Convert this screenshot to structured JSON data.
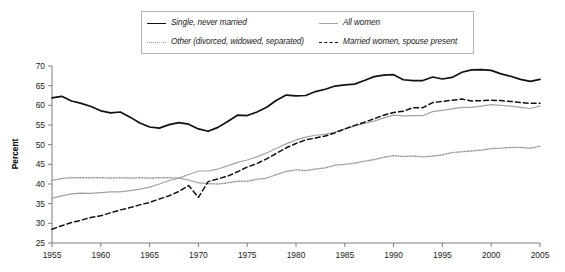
{
  "chart_data": {
    "type": "line",
    "title": "",
    "xlabel": "",
    "ylabel": "Percent",
    "xlim": [
      1955,
      2005
    ],
    "ylim": [
      25,
      70
    ],
    "grid": false,
    "legend_position": "top",
    "x_ticks": [
      "1955",
      "1960",
      "1965",
      "1970",
      "1975",
      "1980",
      "1985",
      "1990",
      "1995",
      "2000",
      "2005"
    ],
    "y_ticks": [
      "25",
      "30",
      "35",
      "40",
      "45",
      "50",
      "55",
      "60",
      "65",
      "70"
    ],
    "x": [
      1955,
      1956,
      1957,
      1958,
      1959,
      1960,
      1961,
      1962,
      1963,
      1964,
      1965,
      1966,
      1967,
      1968,
      1969,
      1970,
      1971,
      1972,
      1973,
      1974,
      1975,
      1976,
      1977,
      1978,
      1979,
      1980,
      1981,
      1982,
      1983,
      1984,
      1985,
      1986,
      1987,
      1988,
      1989,
      1990,
      1991,
      1992,
      1993,
      1994,
      1995,
      1996,
      1997,
      1998,
      1999,
      2000,
      2001,
      2002,
      2003,
      2004,
      2005
    ],
    "series": [
      {
        "name": "Single, never married",
        "style": "solid",
        "color": "#111111",
        "width": 1.7,
        "values": [
          61.9,
          62.3,
          61.1,
          60.5,
          59.7,
          58.6,
          58.1,
          58.3,
          57.0,
          55.5,
          54.5,
          54.2,
          55.1,
          55.6,
          55.2,
          54.0,
          53.4,
          54.4,
          55.9,
          57.5,
          57.4,
          58.3,
          59.5,
          61.3,
          62.6,
          62.4,
          62.5,
          63.5,
          64.1,
          64.9,
          65.2,
          65.4,
          66.3,
          67.3,
          67.7,
          67.8,
          66.5,
          66.3,
          66.3,
          67.2,
          66.7,
          67.1,
          68.4,
          69.0,
          69.1,
          68.9,
          68.0,
          67.4,
          66.6,
          66.1,
          66.6
        ]
      },
      {
        "name": "Other (divorced, widowed, separated)",
        "style": "dotted",
        "color": "#9a9a9a",
        "width": 1.4,
        "values": [
          40.9,
          41.4,
          41.6,
          41.6,
          41.6,
          41.6,
          41.5,
          41.6,
          41.5,
          41.6,
          41.5,
          41.6,
          41.6,
          41.5,
          41.0,
          40.3,
          40.1,
          40.0,
          40.3,
          40.7,
          40.7,
          41.2,
          41.5,
          42.4,
          43.2,
          43.6,
          43.4,
          43.8,
          44.1,
          44.8,
          45.0,
          45.3,
          45.8,
          46.2,
          46.8,
          47.2,
          47.0,
          47.1,
          46.9,
          47.1,
          47.4,
          48.0,
          48.2,
          48.4,
          48.6,
          49.0,
          49.1,
          49.3,
          49.3,
          49.1,
          49.6
        ]
      },
      {
        "name": "All women",
        "style": "solid",
        "color": "#a3a3a3",
        "width": 1.2,
        "values": [
          36.4,
          37.0,
          37.5,
          37.7,
          37.6,
          37.8,
          38.0,
          38.0,
          38.3,
          38.7,
          39.2,
          40.0,
          40.9,
          41.5,
          42.4,
          43.3,
          43.3,
          43.8,
          44.6,
          45.5,
          46.1,
          46.9,
          47.9,
          49.1,
          50.2,
          51.2,
          51.9,
          52.4,
          52.6,
          53.2,
          54.0,
          54.7,
          55.4,
          56.0,
          56.8,
          57.5,
          57.3,
          57.4,
          57.4,
          58.4,
          58.7,
          59.1,
          59.5,
          59.5,
          59.8,
          60.2,
          60.0,
          59.8,
          59.5,
          59.2,
          59.8
        ]
      },
      {
        "name": "Married women, spouse present",
        "style": "dashed",
        "color": "#111111",
        "width": 1.5,
        "values": [
          28.5,
          29.4,
          30.2,
          30.8,
          31.5,
          31.9,
          32.7,
          33.4,
          34.0,
          34.7,
          35.3,
          36.2,
          37.0,
          38.1,
          39.6,
          36.6,
          40.6,
          41.3,
          42.0,
          43.1,
          44.3,
          45.2,
          46.4,
          47.8,
          49.2,
          50.3,
          51.2,
          51.7,
          52.2,
          53.0,
          54.0,
          54.9,
          55.7,
          56.6,
          57.5,
          58.2,
          58.5,
          59.4,
          59.4,
          60.7,
          61.0,
          61.3,
          61.6,
          61.1,
          61.2,
          61.3,
          61.2,
          61.0,
          60.7,
          60.5,
          60.5
        ]
      }
    ]
  },
  "legend": {
    "items": [
      {
        "label": "Single, never married",
        "swatch": "solid-black-line-icon"
      },
      {
        "label": "All women",
        "swatch": "solid-gray-line-icon"
      },
      {
        "label": "Other (divorced, widowed, separated)",
        "swatch": "dotted-gray-line-icon"
      },
      {
        "label": "Married women, spouse present",
        "swatch": "dashed-black-line-icon"
      }
    ]
  },
  "axes": {
    "y_title": "Percent"
  }
}
